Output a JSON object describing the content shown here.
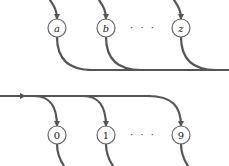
{
  "diagram": {
    "top_row": {
      "nodes": [
        {
          "label": "a",
          "cx": 57,
          "cy": 28
        },
        {
          "label": "b",
          "cx": 106,
          "cy": 28
        },
        {
          "label": "z",
          "cx": 181,
          "cy": 28
        }
      ],
      "ellipsis": "· · ·"
    },
    "bottom_row": {
      "nodes": [
        {
          "label": "0",
          "cx": 57,
          "cy": 135
        },
        {
          "label": "1",
          "cx": 106,
          "cy": 135
        },
        {
          "label": "9",
          "cx": 181,
          "cy": 135
        }
      ],
      "ellipsis": "· · ·"
    },
    "colors": {
      "wire": "#555555",
      "node_stroke": "#666666"
    }
  }
}
